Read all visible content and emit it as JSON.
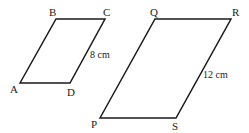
{
  "figure": {
    "small_parallelogram": {
      "vertices": {
        "A": "A",
        "B": "B",
        "C": "C",
        "D": "D"
      },
      "side_label": "8 cm"
    },
    "large_parallelogram": {
      "vertices": {
        "P": "P",
        "Q": "Q",
        "R": "R",
        "S": "S"
      },
      "side_label": "12 cm"
    }
  }
}
